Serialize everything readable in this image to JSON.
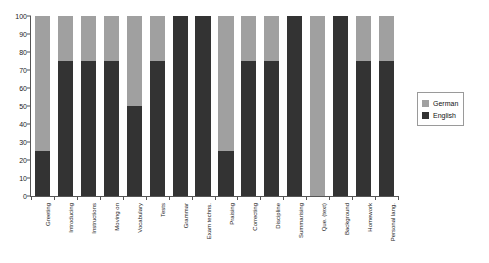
{
  "chart_data": {
    "type": "bar",
    "stacked": true,
    "orientation": "vertical",
    "title": "",
    "subtitle": "",
    "xlabel": "",
    "ylabel": "",
    "ylim": [
      0,
      100
    ],
    "yticks": [
      0,
      10,
      20,
      30,
      40,
      50,
      60,
      70,
      80,
      90,
      100
    ],
    "grid": false,
    "legend_position": "right",
    "categories": [
      "Greeting",
      "Introducing",
      "Instructions",
      "Moving on",
      "Vocabulary",
      "Tests",
      "Grammar",
      "Exam techns.",
      "Praising",
      "Correcting",
      "Discipline",
      "Summarising",
      "Que. (text)",
      "Background",
      "Homework",
      "Personal lang."
    ],
    "series": [
      {
        "name": "English",
        "color": "#333333",
        "values": [
          25,
          75,
          75,
          75,
          50,
          75,
          100,
          100,
          25,
          75,
          75,
          100,
          0,
          100,
          75,
          75
        ]
      },
      {
        "name": "German",
        "color": "#a0a0a0",
        "values": [
          75,
          25,
          25,
          25,
          50,
          25,
          0,
          0,
          75,
          25,
          25,
          0,
          100,
          0,
          25,
          25
        ]
      }
    ]
  },
  "legend": {
    "items": [
      {
        "label": "German",
        "color": "#a0a0a0"
      },
      {
        "label": "English",
        "color": "#333333"
      }
    ]
  }
}
